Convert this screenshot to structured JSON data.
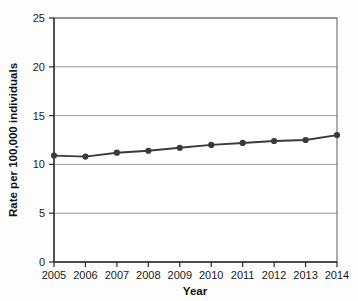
{
  "chart_data": {
    "type": "line",
    "title": "",
    "xlabel": "Year",
    "ylabel": "Rate per 100,000 individuals",
    "categories": [
      "2005",
      "2006",
      "2007",
      "2008",
      "2009",
      "2010",
      "2011",
      "2012",
      "2013",
      "2014"
    ],
    "values": [
      10.9,
      10.8,
      11.2,
      11.4,
      11.7,
      12.0,
      12.2,
      12.4,
      12.5,
      13.0
    ],
    "series": [
      {
        "name": "Rate",
        "values": [
          10.9,
          10.8,
          11.2,
          11.4,
          11.7,
          12.0,
          12.2,
          12.4,
          12.5,
          13.0
        ]
      }
    ],
    "xlim": [
      2005,
      2014
    ],
    "ylim": [
      0,
      25
    ],
    "yticks": [
      0,
      5,
      10,
      15,
      20,
      25
    ],
    "ytick_labels": [
      "0",
      "5",
      "10",
      "15",
      "20",
      "25"
    ],
    "xticks": [
      2005,
      2006,
      2007,
      2008,
      2009,
      2010,
      2011,
      2012,
      2013,
      2014
    ],
    "xtick_labels": [
      "2005",
      "2006",
      "2007",
      "2008",
      "2009",
      "2010",
      "2011",
      "2012",
      "2013",
      "2014"
    ],
    "grid": "horizontal",
    "legend": "none",
    "marker": "circle",
    "colors": {
      "line": "#3a3a3a",
      "marker": "#3a3a3a",
      "gridline": "#8d8d8d",
      "axis": "#2b2b2b",
      "background": "#ffffff"
    }
  }
}
